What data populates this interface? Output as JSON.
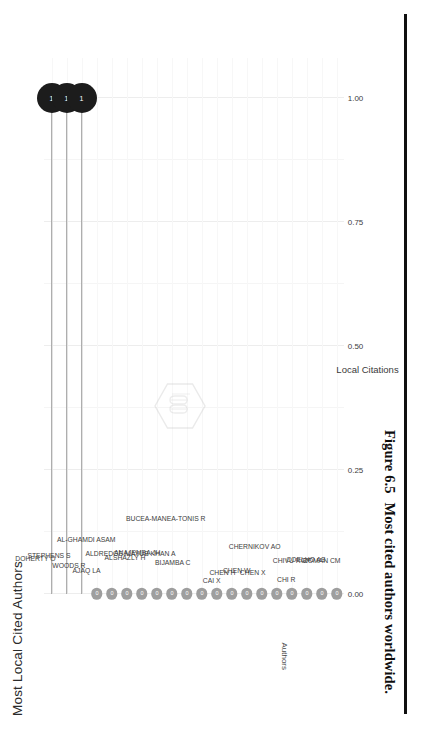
{
  "caption": {
    "number": "Figure 6.5",
    "text": "Most cited authors worldwide."
  },
  "chart_data": {
    "type": "bar",
    "title": "Most Local Cited Authors",
    "xlabel": "Local Citations",
    "ylabel": "Authors",
    "xlim": [
      0,
      1.08
    ],
    "xticks": [
      "0.00",
      "0.25",
      "0.50",
      "0.75",
      "1.00"
    ],
    "xtick_values": [
      0.0,
      0.25,
      0.5,
      0.75,
      1.0
    ],
    "grid": true,
    "legend": "none",
    "orientation": "horizontal-lollipop",
    "categories": [
      "DOHERTY O",
      "STEPHENS S",
      "WOODS R",
      "AJAQ LA",
      "AL-GHAMDI ASAM",
      "ALDREDGE M",
      "ALSHAZLY H",
      "ANAJEMBA JH",
      "AYUB KHAN A",
      "BIJAMBA C",
      "BUCEA-MANEA-TONIS R",
      "CAI X",
      "CHEN H",
      "CHEN W",
      "CHEN X",
      "CHERNIKOV AO",
      "CHI R",
      "CHIVU RGP",
      "COELHO AS",
      "COMAN CM"
    ],
    "values": [
      1,
      1,
      1,
      0,
      0,
      0,
      0,
      0,
      0,
      0,
      0,
      0,
      0,
      0,
      0,
      0,
      0,
      0,
      0,
      0
    ],
    "point_labels": [
      "1",
      "1",
      "1",
      "0",
      "0",
      "0",
      "0",
      "0",
      "0",
      "0",
      "0",
      "0",
      "0",
      "0",
      "0",
      "0",
      "0",
      "0",
      "0",
      "0"
    ],
    "colors": {
      "high_marker": "#1c1c1c",
      "low_marker": "#9e9e9e",
      "stem": "#9a9a9a",
      "grid": "#ededed",
      "text": "#3a3a3a"
    }
  },
  "watermark": {
    "shape": "hexagon-outline",
    "glyph": "book-logo"
  }
}
